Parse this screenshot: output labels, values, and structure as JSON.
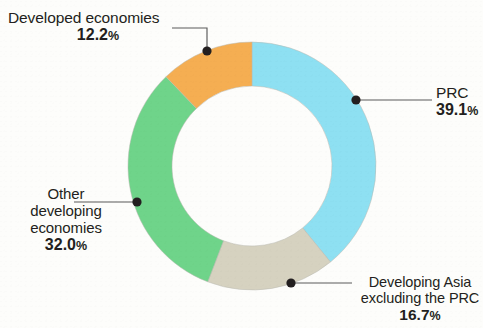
{
  "background_color": "#fdfdfb",
  "geometry": {
    "center_x": 252,
    "center_y": 166,
    "outer_radius": 124,
    "inner_radius": 80
  },
  "chart_data": {
    "type": "pie",
    "variant": "donut",
    "title": "",
    "subtitle": "",
    "xlabel": "",
    "ylabel": "",
    "units": "%",
    "total": 100.0,
    "start_angle_deg": 0,
    "direction": "clockwise",
    "legend_position": "callout-labels",
    "grid": false,
    "categories": [
      "PRC",
      "Developing Asia excluding the PRC",
      "Other developing economies",
      "Developed economies"
    ],
    "values": [
      39.1,
      16.7,
      32.0,
      12.2
    ],
    "colors": [
      "#8ee0f2",
      "#d6d2c0",
      "#6fd48a",
      "#f5ae52"
    ],
    "slices": [
      {
        "id": "prc",
        "label": "PRC",
        "value": 39.1,
        "value_text": "39.1",
        "percent_suffix": "%",
        "color": "#8ee0f2",
        "start_deg": 0,
        "end_deg": 140.76
      },
      {
        "id": "developing-asia-excluding-prc",
        "label_line_1": "Developing Asia",
        "label_line_2": "excluding the PRC",
        "value": 16.7,
        "value_text": "16.7",
        "percent_suffix": "%",
        "color": "#d6d2c0",
        "start_deg": 140.76,
        "end_deg": 200.88
      },
      {
        "id": "other-developing-economies",
        "label_line_1": "Other",
        "label_line_2": "developing",
        "label_line_3": "economies",
        "value": 32.0,
        "value_text": "32.0",
        "percent_suffix": "%",
        "color": "#6fd48a",
        "start_deg": 200.88,
        "end_deg": 316.08
      },
      {
        "id": "developed-economies",
        "label": "Developed economies",
        "value": 12.2,
        "value_text": "12.2",
        "percent_suffix": "%",
        "color": "#f5ae52",
        "start_deg": 316.08,
        "end_deg": 360.0
      }
    ]
  },
  "labels": {
    "developed": {
      "name": "Developed economies",
      "value_text": "12.2",
      "percent_suffix": "%"
    },
    "prc": {
      "name": "PRC",
      "value_text": "39.1",
      "percent_suffix": "%"
    },
    "developing_asia": {
      "name_line_1": "Developing Asia",
      "name_line_2": "excluding the PRC",
      "value_text": "16.7",
      "percent_suffix": "%"
    },
    "other_developing": {
      "name_line_1": "Other",
      "name_line_2": "developing",
      "name_line_3": "economies",
      "value_text": "32.0",
      "percent_suffix": "%"
    }
  }
}
